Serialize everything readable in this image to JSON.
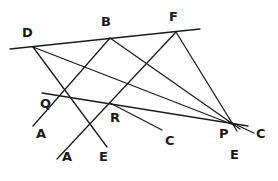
{
  "diagram": {
    "type": "geometric-line-figure",
    "stroke_color": "#1c1c1c",
    "background_color": "#ffffff",
    "stroke_width": 1.3,
    "width": 278,
    "height": 181,
    "points": [
      {
        "id": "D",
        "label": "D",
        "x": 33,
        "y": 47,
        "label_x": 22,
        "label_y": 26
      },
      {
        "id": "B",
        "label": "B",
        "x": 110,
        "y": 38,
        "label_x": 101,
        "label_y": 15
      },
      {
        "id": "F",
        "label": "F",
        "x": 176,
        "y": 32,
        "label_x": 169,
        "label_y": 10
      },
      {
        "id": "Q",
        "label": "Q",
        "x": 61,
        "y": 96,
        "label_x": 40,
        "label_y": 97
      },
      {
        "id": "R",
        "label": "R",
        "x": 117,
        "y": 107,
        "label_x": 110,
        "label_y": 111
      },
      {
        "id": "P",
        "label": "P",
        "x": 232,
        "y": 124,
        "label_x": 219,
        "label_y": 127
      }
    ],
    "ray_labels": [
      {
        "id": "A-at-Q",
        "label": "A",
        "x": 36,
        "y": 127
      },
      {
        "id": "A-at-R",
        "label": "A",
        "x": 62,
        "y": 150
      },
      {
        "id": "E-at-Q",
        "label": "E",
        "x": 99,
        "y": 150
      },
      {
        "id": "C-at-R",
        "label": "C",
        "x": 165,
        "y": 134
      },
      {
        "id": "C-at-P",
        "label": "C",
        "x": 256,
        "y": 127
      },
      {
        "id": "E-at-P",
        "label": "E",
        "x": 230,
        "y": 148
      }
    ],
    "lines": [
      {
        "id": "line-DBF-top",
        "from": "edge-left",
        "to": "edge-right",
        "x1": 10,
        "y1": 49,
        "x2": 200,
        "y2": 29
      },
      {
        "id": "line-QRP-transversal",
        "from": "Q-left",
        "to": "P-right",
        "x1": 42,
        "y1": 93,
        "x2": 248,
        "y2": 126
      },
      {
        "id": "line-D-to-P",
        "from": "D",
        "to": "P",
        "x1": 33,
        "y1": 47,
        "x2": 232,
        "y2": 124
      },
      {
        "id": "line-D-through-Q-to-E",
        "from": "D",
        "to": "E-at-Q",
        "x1": 33,
        "y1": 47,
        "x2": 107,
        "y2": 146
      },
      {
        "id": "line-B-through-Q-to-A",
        "from": "B",
        "to": "A-at-Q",
        "x1": 110,
        "y1": 38,
        "x2": 33,
        "y2": 126
      },
      {
        "id": "line-B-through-R-to-P",
        "from": "B",
        "to": "P",
        "x1": 110,
        "y1": 38,
        "x2": 240,
        "y2": 128
      },
      {
        "id": "line-F-through-R-to-A",
        "from": "F",
        "to": "A-at-R",
        "x1": 176,
        "y1": 32,
        "x2": 58,
        "y2": 158
      },
      {
        "id": "line-F-to-P",
        "from": "F",
        "to": "P",
        "x1": 176,
        "y1": 32,
        "x2": 236,
        "y2": 130
      },
      {
        "id": "line-Q-to-R-to-C",
        "from": "R",
        "to": "C-at-R",
        "x1": 117,
        "y1": 107,
        "x2": 162,
        "y2": 130
      },
      {
        "id": "line-P-to-C",
        "from": "P",
        "to": "C-at-P",
        "x1": 232,
        "y1": 124,
        "x2": 254,
        "y2": 133
      }
    ]
  }
}
